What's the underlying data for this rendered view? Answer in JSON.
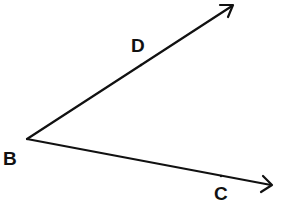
{
  "diagram": {
    "vertex": {
      "label": "B",
      "x": 27,
      "y": 139
    },
    "rays": [
      {
        "name": "ray-BD",
        "through_point": "D",
        "end": {
          "x": 233,
          "y": 5
        }
      },
      {
        "name": "ray-BC",
        "through_point": "C",
        "end": {
          "x": 272,
          "y": 185
        }
      }
    ],
    "labels": {
      "B": {
        "text": "B",
        "x": 3,
        "y": 165
      },
      "D": {
        "text": "D",
        "x": 131,
        "y": 52
      },
      "C": {
        "text": "C",
        "x": 214,
        "y": 200
      }
    },
    "colors": {
      "stroke": "#111111",
      "background": "#ffffff"
    }
  }
}
